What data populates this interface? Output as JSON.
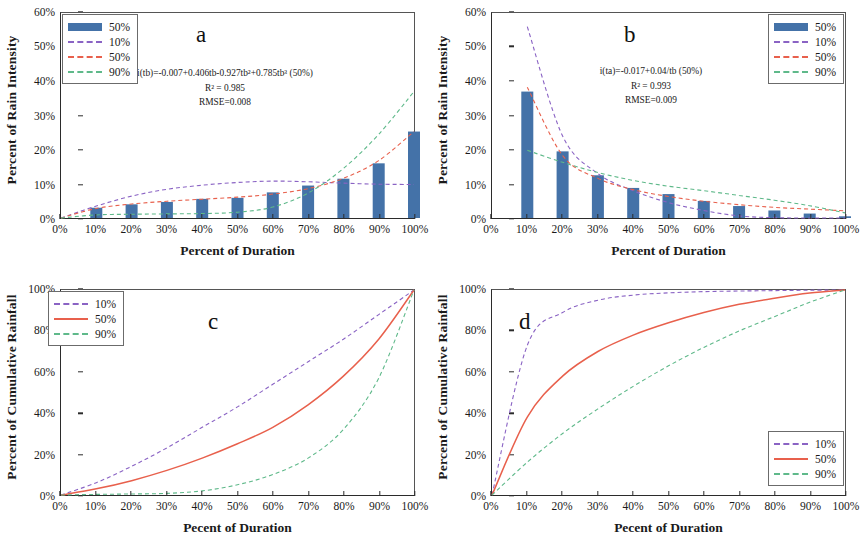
{
  "figure": {
    "panels": [
      "a",
      "b",
      "c",
      "d"
    ],
    "colors": {
      "bar": "#4472a8",
      "p10": "#8a63c4",
      "p50_line": "#e8604c",
      "p90": "#5fb98a",
      "axis": "#2b2b2b"
    }
  },
  "panel_a": {
    "label": "a",
    "xlabel": "Percent of Duration",
    "ylabel": "Percent of Rain Intensity",
    "yticks": [
      "0%",
      "10%",
      "20%",
      "30%",
      "40%",
      "50%",
      "60%"
    ],
    "xticks": [
      "0%",
      "10%",
      "20%",
      "30%",
      "40%",
      "50%",
      "60%",
      "70%",
      "80%",
      "90%",
      "100%"
    ],
    "equation": "i(tb)=-0.007+0.406tb-0.927tb²+0.785tb³ (50%)",
    "r2": "R² = 0.985",
    "rmse": "RMSE=0.008",
    "legend": [
      {
        "label": "50%",
        "style": "bar",
        "color": "#4472a8"
      },
      {
        "label": "10%",
        "style": "dash",
        "color": "#8a63c4"
      },
      {
        "label": "50%",
        "style": "dash",
        "color": "#e8604c"
      },
      {
        "label": "90%",
        "style": "dash",
        "color": "#5fb98a"
      }
    ]
  },
  "panel_b": {
    "label": "b",
    "xlabel": "Percent of Duration",
    "ylabel": "Percent of Rain Intensity",
    "yticks": [
      "0%",
      "10%",
      "20%",
      "30%",
      "40%",
      "50%",
      "60%"
    ],
    "xticks": [
      "0%",
      "10%",
      "20%",
      "30%",
      "40%",
      "50%",
      "60%",
      "70%",
      "80%",
      "90%",
      "100%"
    ],
    "equation": "i(ta)=-0.017+0.04/tb (50%)",
    "r2": "R² = 0.993",
    "rmse": "RMSE=0.009",
    "legend": [
      {
        "label": "50%",
        "style": "bar",
        "color": "#4472a8"
      },
      {
        "label": "10%",
        "style": "dash",
        "color": "#8a63c4"
      },
      {
        "label": "50%",
        "style": "dash",
        "color": "#e8604c"
      },
      {
        "label": "90%",
        "style": "dash",
        "color": "#5fb98a"
      }
    ]
  },
  "panel_c": {
    "label": "c",
    "xlabel": "Pecent of Duration",
    "ylabel": "Percent of  Cumulative Rainfall",
    "yticks": [
      "0%",
      "20%",
      "40%",
      "60%",
      "80%",
      "100%"
    ],
    "xticks": [
      "0%",
      "10%",
      "20%",
      "30%",
      "40%",
      "50%",
      "60%",
      "70%",
      "80%",
      "90%",
      "100%"
    ],
    "legend": [
      {
        "label": "10%",
        "style": "dash",
        "color": "#8a63c4"
      },
      {
        "label": "50%",
        "style": "solid",
        "color": "#e8604c"
      },
      {
        "label": "90%",
        "style": "dash",
        "color": "#5fb98a"
      }
    ]
  },
  "panel_d": {
    "label": "d",
    "xlabel": "Pecent of Duration",
    "ylabel": "Percent of  Cumulative Rainfall",
    "yticks": [
      "0%",
      "20%",
      "40%",
      "60%",
      "80%",
      "100%"
    ],
    "xticks": [
      "0%",
      "10%",
      "20%",
      "30%",
      "40%",
      "50%",
      "60%",
      "70%",
      "80%",
      "90%",
      "100%"
    ],
    "legend": [
      {
        "label": "10%",
        "style": "dash",
        "color": "#8a63c4"
      },
      {
        "label": "50%",
        "style": "solid",
        "color": "#e8604c"
      },
      {
        "label": "90%",
        "style": "dash",
        "color": "#5fb98a"
      }
    ]
  },
  "chart_data": [
    {
      "type": "bar",
      "panel": "a",
      "title": "a",
      "xlabel": "Percent of Duration",
      "ylabel": "Percent of Rain Intensity",
      "xlim": [
        0,
        100
      ],
      "ylim": [
        0,
        60
      ],
      "grid": false,
      "legend_position": "top-left",
      "categories": [
        "0%",
        "10%",
        "20%",
        "30%",
        "40%",
        "50%",
        "60%",
        "70%",
        "80%",
        "90%",
        "100%"
      ],
      "x": [
        0,
        10,
        20,
        30,
        40,
        50,
        60,
        70,
        80,
        90,
        100
      ],
      "values": [
        0,
        3.0,
        4.0,
        4.7,
        5.6,
        5.9,
        7.5,
        9.5,
        11.5,
        16.0,
        25.3
      ],
      "series": [
        {
          "name": "10%",
          "type": "line",
          "style": "dashed",
          "color": "#8a63c4",
          "x": [
            0,
            10,
            20,
            30,
            40,
            50,
            60,
            70,
            80,
            90,
            100
          ],
          "values": [
            0,
            3.5,
            6.4,
            8.4,
            9.6,
            10.4,
            10.8,
            10.6,
            10.2,
            9.9,
            9.8
          ]
        },
        {
          "name": "50%",
          "type": "line",
          "style": "dashed",
          "color": "#e8604c",
          "x": [
            0,
            10,
            20,
            30,
            40,
            50,
            60,
            70,
            80,
            90,
            100
          ],
          "values": [
            0,
            2.8,
            4.1,
            4.9,
            5.5,
            6.1,
            7.0,
            8.6,
            11.6,
            16.8,
            25.3
          ]
        },
        {
          "name": "90%",
          "type": "line",
          "style": "dashed",
          "color": "#5fb98a",
          "x": [
            0,
            10,
            20,
            30,
            40,
            50,
            60,
            70,
            80,
            90,
            100
          ],
          "values": [
            0,
            0.9,
            1.1,
            1.2,
            1.3,
            1.7,
            3.2,
            7.3,
            14.5,
            24.5,
            37.0
          ]
        }
      ],
      "annotations": [
        "i(tb)=-0.007+0.406tb-0.927tb²+0.785tb³ (50%)",
        "R² = 0.985",
        "RMSE=0.008"
      ]
    },
    {
      "type": "bar",
      "panel": "b",
      "title": "b",
      "xlabel": "Percent of Duration",
      "ylabel": "Percent of Rain Intensity",
      "xlim": [
        0,
        100
      ],
      "ylim": [
        0,
        60
      ],
      "grid": false,
      "legend_position": "top-right",
      "categories": [
        "0%",
        "10%",
        "20%",
        "30%",
        "40%",
        "50%",
        "60%",
        "70%",
        "80%",
        "90%",
        "100%"
      ],
      "x": [
        0,
        10,
        20,
        30,
        40,
        50,
        60,
        70,
        80,
        90,
        100
      ],
      "values": [
        0,
        37.0,
        19.5,
        12.5,
        8.8,
        7.0,
        5.0,
        3.5,
        2.2,
        1.3,
        0.5
      ],
      "series": [
        {
          "name": "10%",
          "type": "line",
          "style": "dashed",
          "color": "#8a63c4",
          "x": [
            10,
            20,
            30,
            40,
            50,
            60,
            70,
            80,
            90,
            100
          ],
          "values": [
            56.0,
            24.0,
            13.0,
            8.0,
            4.5,
            2.2,
            0.6,
            0.1,
            0.0,
            0.0
          ]
        },
        {
          "name": "50%",
          "type": "line",
          "style": "dashed",
          "color": "#e8604c",
          "x": [
            10,
            20,
            30,
            40,
            50,
            60,
            70,
            80,
            90,
            100
          ],
          "values": [
            38.3,
            18.3,
            11.6,
            8.3,
            6.3,
            4.9,
            3.9,
            3.1,
            2.6,
            2.1
          ]
        },
        {
          "name": "90%",
          "type": "line",
          "style": "dashed",
          "color": "#5fb98a",
          "x": [
            10,
            20,
            30,
            40,
            50,
            60,
            70,
            80,
            90,
            100
          ],
          "values": [
            19.8,
            16.3,
            13.3,
            11.0,
            9.3,
            8.0,
            6.6,
            5.2,
            3.6,
            1.5
          ]
        }
      ],
      "annotations": [
        "i(ta)=-0.017+0.04/tb (50%)",
        "R² = 0.993",
        "RMSE=0.009"
      ]
    },
    {
      "type": "line",
      "panel": "c",
      "title": "c",
      "xlabel": "Pecent of Duration",
      "ylabel": "Percent of  Cumulative Rainfall",
      "xlim": [
        0,
        100
      ],
      "ylim": [
        0,
        100
      ],
      "grid": false,
      "legend_position": "top-left",
      "x": [
        0,
        10,
        20,
        30,
        40,
        50,
        60,
        70,
        80,
        90,
        100
      ],
      "series": [
        {
          "name": "10%",
          "style": "dashed",
          "color": "#8a63c4",
          "values": [
            0,
            6,
            14,
            23,
            33,
            43,
            54,
            65,
            76,
            88,
            100
          ]
        },
        {
          "name": "50%",
          "style": "solid",
          "color": "#e8604c",
          "values": [
            0,
            3,
            7,
            12,
            18,
            25,
            33,
            44,
            58,
            76,
            100
          ]
        },
        {
          "name": "90%",
          "style": "dashed",
          "color": "#5fb98a",
          "values": [
            0,
            0.3,
            0.5,
            0.8,
            2,
            5,
            10,
            18,
            32,
            57,
            100
          ]
        }
      ]
    },
    {
      "type": "line",
      "panel": "d",
      "title": "d",
      "xlabel": "Pecent of Duration",
      "ylabel": "Percent of  Cumulative Rainfall",
      "xlim": [
        0,
        100
      ],
      "ylim": [
        0,
        100
      ],
      "grid": false,
      "legend_position": "bottom-right",
      "x": [
        0,
        10,
        20,
        30,
        40,
        50,
        60,
        70,
        80,
        90,
        100
      ],
      "series": [
        {
          "name": "10%",
          "style": "dashed",
          "color": "#8a63c4",
          "values": [
            0,
            73,
            89,
            95,
            97.5,
            98.6,
            99.2,
            99.5,
            99.7,
            99.9,
            100
          ]
        },
        {
          "name": "50%",
          "style": "solid",
          "color": "#e8604c",
          "values": [
            0,
            38,
            58,
            70,
            78,
            84,
            89,
            93,
            96,
            98.5,
            100
          ]
        },
        {
          "name": "90%",
          "style": "dashed",
          "color": "#5fb98a",
          "values": [
            0,
            16,
            30,
            42,
            53,
            63,
            72,
            80,
            87,
            94,
            100
          ]
        }
      ]
    }
  ]
}
